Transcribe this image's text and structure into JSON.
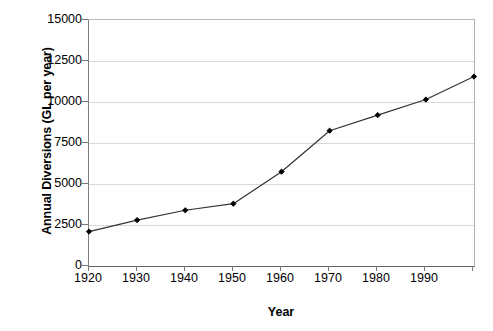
{
  "chart_data": {
    "type": "line",
    "title": "",
    "xlabel": "Year",
    "ylabel": "Annual Diversions (GL per year)",
    "x": [
      1920,
      1930,
      1940,
      1950,
      1960,
      1970,
      1980,
      1990,
      2000
    ],
    "values": [
      2100,
      2800,
      3400,
      3800,
      5750,
      8250,
      9200,
      10150,
      11550
    ],
    "series": [
      {
        "name": "Annual Diversions",
        "values": [
          2100,
          2800,
          3400,
          3800,
          5750,
          8250,
          9200,
          10150,
          11550
        ]
      }
    ],
    "xlim": [
      1920,
      2000
    ],
    "ylim": [
      0,
      15000
    ],
    "ytick_labels": [
      "0",
      "2500",
      "5000",
      "7500",
      "10000",
      "12500",
      "15000"
    ],
    "ytick_values": [
      0,
      2500,
      5000,
      7500,
      10000,
      12500,
      15000
    ],
    "xtick_labels": [
      "1920",
      "1930",
      "1940",
      "1950",
      "1960",
      "1970",
      "1980",
      "1990"
    ],
    "xtick_values": [
      1920,
      1930,
      1940,
      1950,
      1960,
      1970,
      1980,
      1990,
      2000
    ],
    "grid": "horizontal",
    "legend": "none",
    "marker": "filled-diamond",
    "line_color": "#333333",
    "marker_color": "#000000",
    "grid_color": "#d9d9d9",
    "background_color": "#ffffff"
  }
}
